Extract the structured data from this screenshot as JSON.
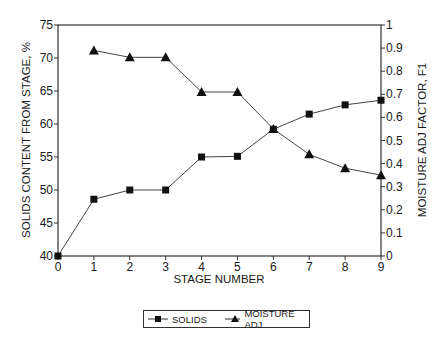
{
  "chart_data": {
    "type": "line",
    "title": "",
    "xlabel": "STAGE NUMBER",
    "ylabel": "SOLIDS CONTENT FROM STAGE, %",
    "y2label": "MOISTURE ADJ FACTOR, F1",
    "x": [
      0,
      1,
      2,
      3,
      4,
      5,
      6,
      7,
      8,
      9
    ],
    "xlim": [
      0,
      9
    ],
    "ylim": [
      40,
      75
    ],
    "y2lim": [
      0,
      1
    ],
    "xticks": [
      "0",
      "1",
      "2",
      "3",
      "4",
      "5",
      "6",
      "7",
      "8",
      "9"
    ],
    "yticks": [
      "40",
      "45",
      "50",
      "55",
      "60",
      "65",
      "70",
      "75"
    ],
    "y2ticks": [
      "0",
      "0.1",
      "0.2",
      "0.3",
      "0.4",
      "0.5",
      "0.6",
      "0.7",
      "0.8",
      "0.9",
      "1"
    ],
    "grid": false,
    "legend_position": "bottom",
    "series": [
      {
        "name": "SOLIDS",
        "axis": "left",
        "marker": "square",
        "x": [
          0,
          1,
          2,
          3,
          4,
          5,
          6,
          7,
          8,
          9
        ],
        "values": [
          40,
          48.6,
          50,
          50,
          55,
          55.1,
          59.2,
          61.5,
          62.9,
          63.6
        ]
      },
      {
        "name": "MOISTURE ADJ",
        "axis": "right",
        "marker": "triangle",
        "x": [
          1,
          2,
          3,
          4,
          5,
          6,
          7,
          8,
          9
        ],
        "values": [
          0.89,
          0.86,
          0.86,
          0.71,
          0.71,
          0.55,
          0.44,
          0.38,
          0.35
        ]
      }
    ]
  },
  "legend": {
    "solids_label": "SOLIDS",
    "moisture_label": "MOISTURE ADJ"
  }
}
